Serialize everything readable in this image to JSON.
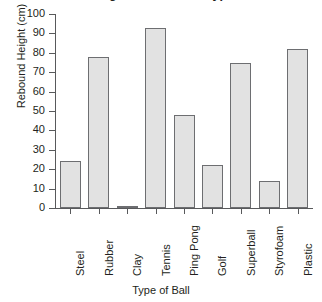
{
  "chart_data": {
    "type": "bar",
    "title": "Rebound Height of Different Types of Balls",
    "xlabel": "Type of Ball",
    "ylabel": "Rebound Height (cm)",
    "categories": [
      "Steel",
      "Rubber",
      "Clay",
      "Tennis",
      "Ping Pong",
      "Golf",
      "Superball",
      "Styrofoam",
      "Plastic"
    ],
    "values": [
      24,
      78,
      1,
      93,
      48,
      22,
      75,
      14,
      82
    ],
    "ylim": [
      0,
      100
    ],
    "ytick_labels": [
      "100",
      "90",
      "80",
      "70",
      "60",
      "50",
      "40",
      "30",
      "20",
      "10",
      "0"
    ],
    "ytick_values": [
      100,
      90,
      80,
      70,
      60,
      50,
      40,
      30,
      20,
      10,
      0
    ],
    "grid": false,
    "legend": false,
    "bar_fill_color": "#e2e2e2",
    "bar_border_color": "#6d6e71",
    "axis_color": "#58595b",
    "text_color": "#231f20",
    "background_color": "#ffffff"
  }
}
